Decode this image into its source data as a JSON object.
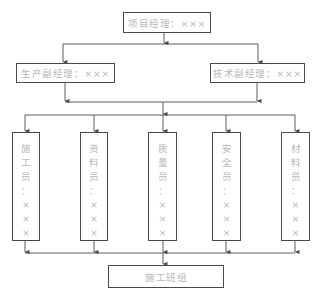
{
  "diagram": {
    "type": "org-chart",
    "colors": {
      "line": "#4a4a4a",
      "text": "#b8b8b8",
      "background": "#ffffff"
    },
    "top": {
      "label": "项目经理：×××"
    },
    "deputies": [
      {
        "label": "生产副经理：×××"
      },
      {
        "label": "技术副经理：×××"
      }
    ],
    "departments": [
      {
        "label": "施工员：×××",
        "chars": [
          "施",
          "工",
          "员",
          "：",
          "×",
          "×",
          "×"
        ]
      },
      {
        "label": "资料员：×××",
        "chars": [
          "资",
          "料",
          "员",
          "：",
          "×",
          "×",
          "×"
        ]
      },
      {
        "label": "质量员：×××",
        "chars": [
          "质",
          "量",
          "员",
          "：",
          "×",
          "×",
          "×"
        ]
      },
      {
        "label": "安全员：×××",
        "chars": [
          "安",
          "全",
          "员",
          "：",
          "×",
          "×",
          "×"
        ]
      },
      {
        "label": "材料员：×××",
        "chars": [
          "材",
          "料",
          "员",
          "：",
          "×",
          "×",
          "×"
        ]
      }
    ],
    "bottom": {
      "label": "施工班组"
    }
  }
}
